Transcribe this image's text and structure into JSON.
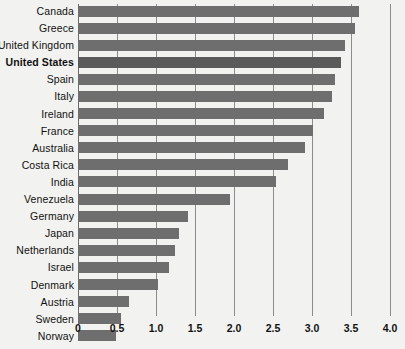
{
  "chart_data": {
    "type": "bar",
    "orientation": "horizontal",
    "title": "",
    "subtitle": "",
    "xlabel": "",
    "ylabel": "",
    "xlim": [
      0,
      4.0
    ],
    "xticks": [
      "0",
      "0.5",
      "1.0",
      "1.5",
      "2.0",
      "2.5",
      "3.0",
      "3.5",
      "4.0"
    ],
    "xtick_values": [
      0,
      0.5,
      1.0,
      1.5,
      2.0,
      2.5,
      3.0,
      3.5,
      4.0
    ],
    "grid": "vertical",
    "legend": "none",
    "categories": [
      "Canada",
      "Greece",
      "United Kingdom",
      "United States",
      "Spain",
      "Italy",
      "Ireland",
      "France",
      "Australia",
      "Costa Rica",
      "India",
      "Venezuela",
      "Germany",
      "Japan",
      "Netherlands",
      "Israel",
      "Denmark",
      "Austria",
      "Sweden",
      "Norway"
    ],
    "values": [
      3.6,
      3.55,
      3.42,
      3.37,
      3.3,
      3.26,
      3.15,
      3.01,
      2.91,
      2.69,
      2.54,
      1.95,
      1.41,
      1.29,
      1.24,
      1.17,
      1.03,
      0.65,
      0.55,
      0.49
    ],
    "highlighted_category": "United States",
    "colors": {
      "background": "#f2f2f0",
      "bar": "#6e6e6e",
      "bar_highlight": "#5a5a5a",
      "gridline": "#8c8c8c",
      "text": "#111111"
    }
  }
}
